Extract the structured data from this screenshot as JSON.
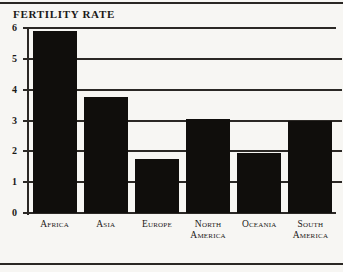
{
  "chart_data": {
    "type": "bar",
    "title": "FERTILITY RATE",
    "xlabel": "",
    "ylabel": "",
    "ylim": [
      0,
      6
    ],
    "yticks": [
      "0",
      "1",
      "2",
      "3",
      "4",
      "5",
      "6"
    ],
    "grid": true,
    "legend": "none",
    "bar_color": "#100e0c",
    "categories": [
      "Africa",
      "Asia",
      "Europe",
      "North America",
      "Oceania",
      "South America"
    ],
    "category_lines": [
      [
        "Africa"
      ],
      [
        "Asia"
      ],
      [
        "Europe"
      ],
      [
        "North",
        "America"
      ],
      [
        "Oceania"
      ],
      [
        "South",
        "America"
      ]
    ],
    "values": [
      5.9,
      3.75,
      1.75,
      3.05,
      1.95,
      3.0
    ]
  }
}
